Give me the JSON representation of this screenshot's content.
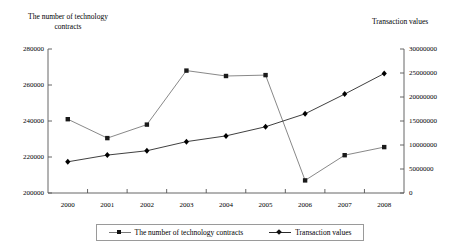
{
  "chart_data": {
    "type": "line",
    "title": "",
    "categories": [
      "2000",
      "2001",
      "2002",
      "2003",
      "2004",
      "2005",
      "2006",
      "2007",
      "2008"
    ],
    "x": [
      2000,
      2001,
      2002,
      2003,
      2004,
      2005,
      2006,
      2007,
      2008
    ],
    "xlabel": "",
    "grid": false,
    "legend_position": "bottom",
    "axes": {
      "left": {
        "label": "The number of technology\ncontracts",
        "ticks": [
          "200000",
          "220000",
          "240000",
          "260000",
          "280000"
        ],
        "tick_values": [
          200000,
          220000,
          240000,
          260000,
          280000
        ],
        "ylim": [
          200000,
          280000
        ]
      },
      "right": {
        "label": "Transaction values",
        "ticks": [
          "0",
          "5000000",
          "10000000",
          "15000000",
          "20000000",
          "25000000",
          "30000000"
        ],
        "tick_values": [
          0,
          5000000,
          10000000,
          15000000,
          20000000,
          25000000,
          30000000
        ],
        "ylim": [
          0,
          30000000
        ]
      }
    },
    "series": [
      {
        "name": "The number of technology contracts",
        "axis": "left",
        "marker": "square",
        "color": "#7a7a7a",
        "marker_color": "#1a1a1a",
        "values": [
          241000,
          230500,
          238000,
          268000,
          265000,
          265500,
          207000,
          221000,
          225500
        ]
      },
      {
        "name": "Transaction values",
        "axis": "right",
        "marker": "diamond",
        "color": "#2a2a2a",
        "marker_color": "#000000",
        "values": [
          6500000,
          7900000,
          8800000,
          10700000,
          11900000,
          13800000,
          16500000,
          20600000,
          24900000
        ]
      }
    ],
    "legend": [
      {
        "label": "The number of technology contracts",
        "marker": "square",
        "color": "#7a7a7a"
      },
      {
        "label": "Transaction values",
        "marker": "diamond",
        "color": "#2a2a2a"
      }
    ]
  },
  "colors": {
    "axis": "#555555",
    "series_contracts": "#7a7a7a",
    "series_transactions": "#2a2a2a",
    "legend_border": "#9a9a9a",
    "background": "#ffffff"
  }
}
